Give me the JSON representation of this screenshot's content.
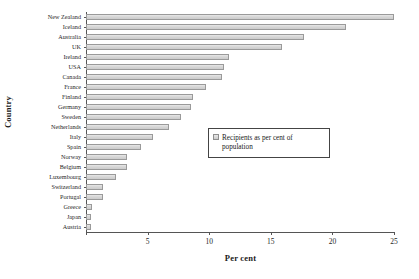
{
  "chart_data": {
    "type": "bar",
    "orientation": "horizontal",
    "title": "",
    "xlabel": "Per cent",
    "ylabel": "Country",
    "xlim": [
      0,
      25
    ],
    "xticks": [
      0,
      5,
      10,
      15,
      20,
      25
    ],
    "grid": false,
    "legend": {
      "position": "middle-right-inset",
      "entries": [
        "Recipients as per cent of population"
      ]
    },
    "series": [
      {
        "name": "Recipients as per cent of population",
        "color": "#d4d4d4"
      }
    ],
    "categories": [
      "New Zealand",
      "Iceland",
      "Australia",
      "UK",
      "Ireland",
      "USA",
      "Canada",
      "France",
      "Finland",
      "Germany",
      "Sweden",
      "Netherlands",
      "Italy",
      "Spain",
      "Norway",
      "Belgium",
      "Luxembourg",
      "Switzerland",
      "Portugal",
      "Greece",
      "Japan",
      "Austria"
    ],
    "values": [
      25.0,
      21.1,
      17.7,
      15.9,
      11.6,
      11.2,
      11.0,
      9.7,
      8.7,
      8.5,
      7.7,
      6.7,
      5.4,
      4.5,
      3.3,
      3.3,
      2.4,
      1.4,
      1.4,
      0.5,
      0.4,
      0.4
    ]
  },
  "labels": {
    "xtick_0": "0",
    "xtick_1": "5",
    "xtick_2": "10",
    "xtick_3": "15",
    "xtick_4": "20",
    "xtick_5": "25",
    "x_title": "Per cent",
    "y_title": "Country",
    "legend_text": "Recipients as per cent of population"
  }
}
